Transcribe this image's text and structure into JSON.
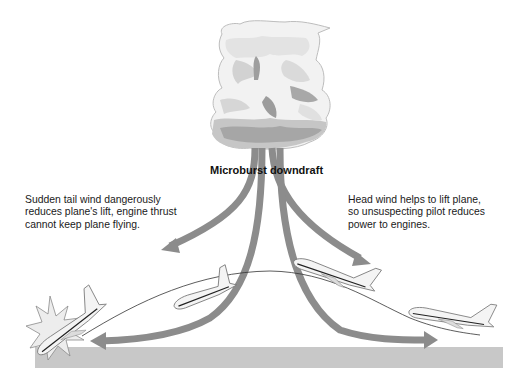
{
  "diagram": {
    "title": "Microburst downdraft",
    "annotations": {
      "left": "Sudden tail wind dangerously\nreduces plane's lift, engine thrust\ncannot keep plane flying.",
      "right": "Head wind helps to lift plane,\nso unsuspecting pilot reduces\npower to engines."
    },
    "elements": [
      {
        "name": "storm-cloud",
        "description": "cumulonimbus thunderstorm cloud"
      },
      {
        "name": "downdraft-arrows",
        "count": 4
      },
      {
        "name": "flight-path",
        "description": "thin curved line showing airplane trajectory"
      },
      {
        "name": "airplanes",
        "count": 4,
        "states": [
          "approaching low right",
          "lifted by head wind",
          "descending in tail wind",
          "crashing at left"
        ]
      },
      {
        "name": "ground",
        "description": "gray ground band"
      }
    ],
    "colors": {
      "arrow": "#8c8c8c",
      "ground": "#c8c8c8",
      "cloud_light": "#f2f2f2",
      "cloud_mid": "#cfcfcf",
      "cloud_dark": "#9a9a9a",
      "text": "#1a1a1a"
    }
  }
}
